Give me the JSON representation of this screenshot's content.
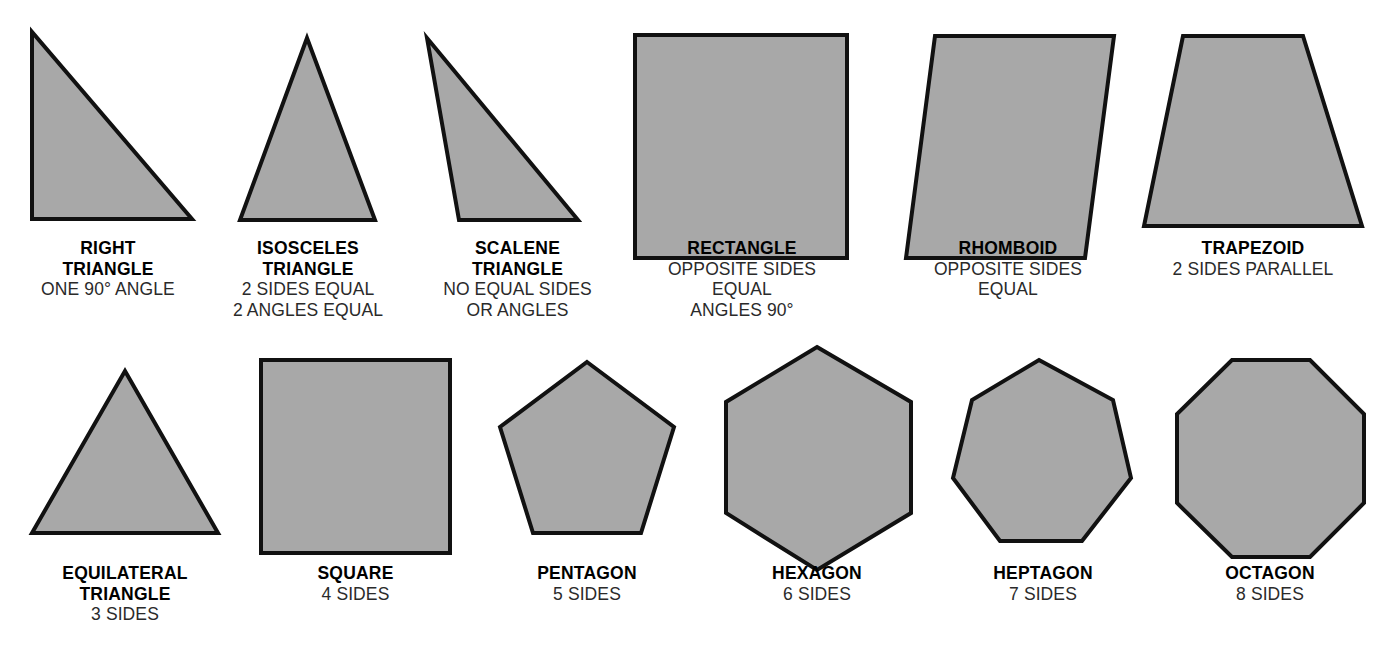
{
  "page": {
    "background_color": "#ffffff",
    "shape_fill_color": "#a8a8a8",
    "shape_stroke_color": "#111111",
    "text_color": "#000000"
  },
  "chart_data": {
    "type": "diagram",
    "xlabel": "",
    "ylabel": "",
    "rows": 2,
    "columns": 6,
    "categories": [
      "RIGHT TRIANGLE",
      "ISOSCELES TRIANGLE",
      "SCALENE TRIANGLE",
      "RECTANGLE",
      "RHOMBOID",
      "TRAPEZOID",
      "EQUILATERAL TRIANGLE",
      "SQUARE",
      "PENTAGON",
      "HEXAGON",
      "HEPTAGON",
      "OCTAGON"
    ],
    "values": [
      3,
      3,
      3,
      4,
      4,
      4,
      3,
      4,
      5,
      6,
      7,
      8
    ],
    "series": [
      {
        "name": "number_of_sides",
        "values": [
          3,
          3,
          3,
          4,
          4,
          4,
          3,
          4,
          5,
          6,
          7,
          8
        ]
      }
    ]
  },
  "shapes": [
    {
      "id": "right-triangle",
      "name_lines": [
        "RIGHT",
        "TRIANGLE"
      ],
      "desc_lines": [
        "ONE 90° ANGLE"
      ],
      "sides": 3,
      "points": "32,32 32,219 192,219"
    },
    {
      "id": "isosceles-triangle",
      "name_lines": [
        "ISOSCELES",
        "TRIANGLE"
      ],
      "desc_lines": [
        "2 SIDES EQUAL",
        "2 ANGLES EQUAL"
      ],
      "sides": 3,
      "points": "307,38 240,220 375,220"
    },
    {
      "id": "scalene-triangle",
      "name_lines": [
        "SCALENE",
        "TRIANGLE"
      ],
      "desc_lines": [
        "NO EQUAL SIDES",
        "OR ANGLES"
      ],
      "sides": 3,
      "points": "427,38 459,220 578,220"
    },
    {
      "id": "rectangle",
      "name_lines": [
        "RECTANGLE"
      ],
      "desc_lines": [
        "OPPOSITE SIDES",
        "EQUAL",
        "ANGLES 90°"
      ],
      "sides": 4,
      "points": "635,35 847,35 847,258 635,258"
    },
    {
      "id": "rhomboid",
      "name_lines": [
        "RHOMBOID"
      ],
      "desc_lines": [
        "OPPOSITE SIDES",
        "EQUAL"
      ],
      "sides": 4,
      "points": "935,36 1114,36 1085,258 906,258"
    },
    {
      "id": "trapezoid",
      "name_lines": [
        "TRAPEZOID"
      ],
      "desc_lines": [
        "2 SIDES PARALLEL"
      ],
      "sides": 4,
      "points": "1183,36 1303,36 1362,226 1144,226"
    },
    {
      "id": "equilateral-triangle",
      "name_lines": [
        "EQUILATERAL",
        "TRIANGLE"
      ],
      "desc_lines": [
        "3 SIDES"
      ],
      "sides": 3,
      "points": "125,371 218,533 32,533"
    },
    {
      "id": "square",
      "name_lines": [
        "SQUARE"
      ],
      "desc_lines": [
        "4 SIDES"
      ],
      "sides": 4,
      "points": "261,360 450,360 450,553 261,553"
    },
    {
      "id": "pentagon",
      "name_lines": [
        "PENTAGON"
      ],
      "desc_lines": [
        "5 SIDES"
      ],
      "sides": 5,
      "points": "587,362 674,427 641,533 533,533 500,427"
    },
    {
      "id": "hexagon",
      "name_lines": [
        "HEXAGON"
      ],
      "desc_lines": [
        "6 SIDES"
      ],
      "sides": 6,
      "points": "817,347 911,402 911,513 817,570 726,513 726,402"
    },
    {
      "id": "heptagon",
      "name_lines": [
        "HEPTAGON"
      ],
      "desc_lines": [
        "7 SIDES"
      ],
      "sides": 7,
      "points": "1039,360 1113,400 1131,478 1082,541 1000,541 953,478 972,400"
    },
    {
      "id": "octagon",
      "name_lines": [
        "OCTAGON"
      ],
      "desc_lines": [
        "8 SIDES"
      ],
      "sides": 8,
      "points": "1232,360 1310,360 1364,414 1364,503 1310,557 1232,557 1177,503 1177,414"
    }
  ],
  "captions": [
    {
      "id": "right-triangle",
      "left": 8,
      "top": 238,
      "width": 200
    },
    {
      "id": "isosceles-triangle",
      "left": 208,
      "top": 238,
      "width": 200
    },
    {
      "id": "scalene-triangle",
      "left": 415,
      "top": 238,
      "width": 205
    },
    {
      "id": "rectangle",
      "left": 636,
      "top": 238,
      "width": 212
    },
    {
      "id": "rhomboid",
      "left": 900,
      "top": 238,
      "width": 216
    },
    {
      "id": "trapezoid",
      "left": 1143,
      "top": 238,
      "width": 220
    },
    {
      "id": "equilateral-triangle",
      "left": 25,
      "top": 563,
      "width": 200
    },
    {
      "id": "square",
      "left": 258,
      "top": 563,
      "width": 195
    },
    {
      "id": "pentagon",
      "left": 487,
      "top": 563,
      "width": 200
    },
    {
      "id": "hexagon",
      "left": 718,
      "top": 563,
      "width": 198
    },
    {
      "id": "heptagon",
      "left": 945,
      "top": 563,
      "width": 196
    },
    {
      "id": "octagon",
      "left": 1172,
      "top": 563,
      "width": 196
    }
  ]
}
